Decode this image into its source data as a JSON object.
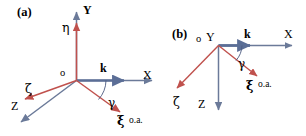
{
  "figure": {
    "width": 306,
    "height": 136,
    "background": "#ffffff",
    "colors": {
      "lab_axis": "#6b7a99",
      "crystal_axis": "#c0514d",
      "wave_vector": "#5b6e96",
      "text": "#000000"
    }
  },
  "panels": [
    {
      "id": "a",
      "tag": "(a)",
      "origin_label": "o",
      "labels": {
        "Y": "Y",
        "X": "X",
        "Z": "Z",
        "eta": "η",
        "zeta": "ζ",
        "xi": "ξ",
        "k": "k",
        "gamma": "γ",
        "oa": "o.a."
      }
    },
    {
      "id": "b",
      "tag": "(b)",
      "origin_label": "o",
      "labels": {
        "Y": "Y",
        "X": "X",
        "Z": "Z",
        "zeta": "ζ",
        "xi": "ξ",
        "k": "k",
        "gamma": "γ",
        "oa": "o.a."
      }
    }
  ]
}
